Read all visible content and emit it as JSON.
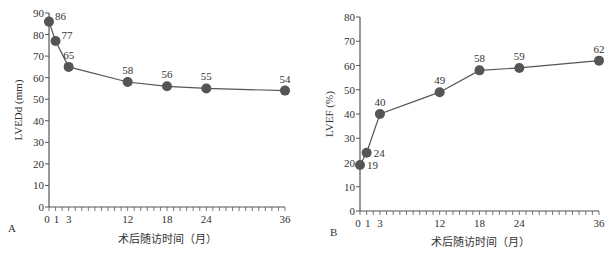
{
  "chart_data": [
    {
      "type": "line",
      "panel": "A",
      "x": [
        0,
        1,
        3,
        12,
        18,
        24,
        36
      ],
      "values": [
        86,
        77,
        65,
        58,
        56,
        55,
        54
      ],
      "labels": [
        "86",
        "77",
        "65",
        "58",
        "56",
        "55",
        "54"
      ],
      "xlabel": "术后随访时间（月）",
      "ylabel": "LVEDd (mm)",
      "xticks": [
        "0",
        "1",
        "3",
        "12",
        "18",
        "24",
        "36"
      ],
      "yticks": [
        "0",
        "10",
        "20",
        "30",
        "40",
        "50",
        "60",
        "70",
        "80",
        "90"
      ],
      "ylim": [
        0,
        90
      ],
      "xlim": [
        0,
        36
      ],
      "grid": false
    },
    {
      "type": "line",
      "panel": "B",
      "x": [
        0,
        1,
        3,
        12,
        18,
        24,
        36
      ],
      "values": [
        19,
        24,
        40,
        49,
        58,
        59,
        62
      ],
      "labels": [
        "19",
        "24",
        "40",
        "49",
        "58",
        "59",
        "62"
      ],
      "xlabel": "术后随访时间（月）",
      "ylabel": "LVEF (%)",
      "xticks": [
        "0",
        "1",
        "3",
        "12",
        "18",
        "24",
        "36"
      ],
      "yticks": [
        "0",
        "10",
        "20",
        "30",
        "40",
        "50",
        "60",
        "70",
        "80"
      ],
      "ylim": [
        0,
        80
      ],
      "xlim": [
        0,
        36
      ],
      "grid": false
    }
  ],
  "colors": {
    "marker": "#555555",
    "line": "#555555",
    "axis": "#555555"
  }
}
